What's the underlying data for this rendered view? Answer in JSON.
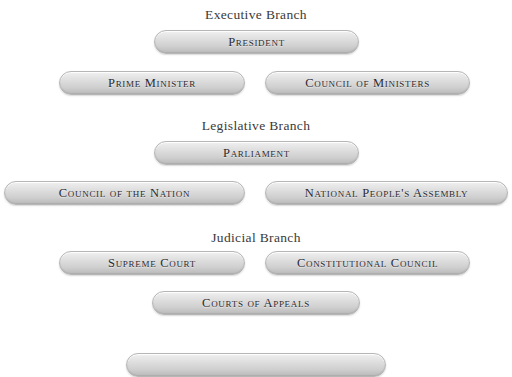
{
  "diagram": {
    "background_color": "#ffffff",
    "pill_fill_top": "#f2f2f2",
    "pill_fill_bottom": "#bdbdbd",
    "pill_border_color": "#b6b6b6",
    "text_color": "#2a2a30",
    "heading_color": "#3a3a3a"
  },
  "branches": [
    {
      "heading": "Executive Branch",
      "nodes": [
        {
          "label": "President"
        },
        {
          "label": "Prime Minister"
        },
        {
          "label": "Council of Ministers"
        }
      ]
    },
    {
      "heading": "Legislative Branch",
      "nodes": [
        {
          "label": "Parliament"
        },
        {
          "label": "Council of the Nation"
        },
        {
          "label": "National People's Assembly"
        }
      ]
    },
    {
      "heading": "Judicial Branch",
      "nodes": [
        {
          "label": "Supreme Court"
        },
        {
          "label": "Constitutional Council"
        },
        {
          "label": "Courts of Appeals"
        }
      ]
    }
  ],
  "partial_node": {
    "label": "",
    "note": "cut off at bottom edge"
  }
}
